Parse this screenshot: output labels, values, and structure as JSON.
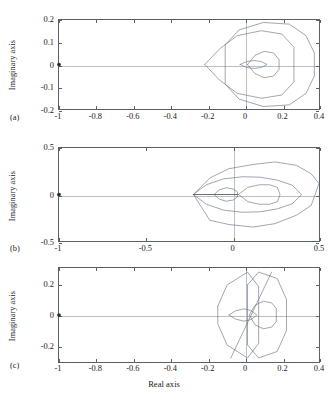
{
  "figure": {
    "background": "#ffffff",
    "curve_color": "#6c7680",
    "axis_color": "#5a6068",
    "grid_color": "#b9c0c8",
    "marker_color": "#2b2f33",
    "xlabel": "Real axis",
    "caption": ""
  },
  "panels": [
    {
      "tag": "(a)",
      "ylabel": "Imaginary axis",
      "xlabel": "",
      "xticks": [
        "-1",
        "-0.8",
        "-0.6",
        "-0.4",
        "-0.2",
        "0",
        "0.2",
        "0.4"
      ],
      "yticks": [
        "0.2",
        "0.1",
        "0",
        "-0.1",
        "-0.2"
      ]
    },
    {
      "tag": "(b)",
      "ylabel": "Imaginary axis",
      "xlabel": "",
      "xticks": [
        "-1",
        "-0.5",
        "0",
        "0.5"
      ],
      "yticks": [
        "0.5",
        "0",
        "-0.5"
      ]
    },
    {
      "tag": "(c)",
      "ylabel": "Imaginary axis",
      "xlabel": "Real axis",
      "xticks": [
        "-1",
        "-0.8",
        "-0.6",
        "-0.4",
        "-0.2",
        "0",
        "0.2",
        "0.4"
      ],
      "yticks": [
        "0.2",
        "0",
        "-0.2"
      ]
    }
  ],
  "chart_data": [
    {
      "type": "line",
      "title": "(a) Nyquist plot",
      "xlabel": "Real axis",
      "ylabel": "Imaginary axis",
      "xlim": [
        -1.0,
        0.4
      ],
      "ylim": [
        -0.27,
        0.27
      ],
      "grid": false,
      "xticks": [
        -1,
        -0.8,
        -0.6,
        -0.4,
        -0.2,
        0,
        0.2,
        0.4
      ],
      "yticks": [
        0.2,
        0.1,
        0,
        -0.1,
        -0.2
      ],
      "annotations": [
        {
          "label": "critical point",
          "x": -1.0,
          "y": 0.0,
          "marker": "dot"
        }
      ],
      "series": [
        {
          "name": "outer contour",
          "x": [
            -0.105,
            -0.03,
            0.1,
            0.24,
            0.33,
            0.375,
            0.375,
            0.33,
            0.24,
            0.1,
            -0.03,
            -0.105,
            -0.105
          ],
          "y": [
            0.12,
            0.21,
            0.255,
            0.245,
            0.175,
            0.07,
            -0.07,
            -0.175,
            -0.245,
            -0.255,
            -0.21,
            -0.12,
            0.12
          ]
        },
        {
          "name": "middle contour",
          "x": [
            -0.215,
            -0.135,
            -0.04,
            0.09,
            0.2,
            0.265,
            0.265,
            0.2,
            0.09,
            -0.04,
            -0.135,
            -0.215,
            -0.215
          ],
          "y": [
            0.0,
            0.095,
            0.175,
            0.205,
            0.185,
            0.105,
            -0.105,
            -0.185,
            -0.205,
            -0.175,
            -0.095,
            0.0,
            0.0
          ]
        },
        {
          "name": "inner contour",
          "x": [
            0.015,
            0.055,
            0.105,
            0.155,
            0.185,
            0.185,
            0.155,
            0.105,
            0.055,
            0.015,
            0.015
          ],
          "y": [
            0.0,
            0.055,
            0.08,
            0.07,
            0.03,
            -0.03,
            -0.07,
            -0.08,
            -0.055,
            0.0,
            0.0
          ]
        },
        {
          "name": "inner lens",
          "x": [
            -0.025,
            0.01,
            0.05,
            0.09,
            0.12,
            0.09,
            0.05,
            0.01,
            -0.025
          ],
          "y": [
            0.0,
            0.018,
            0.024,
            0.018,
            0.0,
            -0.018,
            -0.024,
            -0.018,
            0.0
          ]
        }
      ]
    },
    {
      "type": "line",
      "title": "(b) Nyquist plot",
      "xlabel": "Real axis",
      "ylabel": "Imaginary axis",
      "xlim": [
        -1.0,
        0.5
      ],
      "ylim": [
        -0.55,
        0.55
      ],
      "grid": false,
      "xticks": [
        -1,
        -0.5,
        0,
        0.5
      ],
      "yticks": [
        0.5,
        0,
        -0.5
      ],
      "annotations": [
        {
          "label": "critical point",
          "x": -1.0,
          "y": 0.0,
          "marker": "dot"
        }
      ],
      "series": [
        {
          "name": "outer leaf",
          "x": [
            -0.225,
            -0.13,
            -0.02,
            0.12,
            0.245,
            0.37,
            0.455,
            0.5,
            0.455,
            0.37,
            0.245,
            0.12,
            -0.02,
            -0.13,
            -0.225
          ],
          "y": [
            0.0,
            0.195,
            0.305,
            0.355,
            0.385,
            0.345,
            0.245,
            0.13,
            -0.13,
            -0.245,
            -0.345,
            -0.385,
            -0.355,
            -0.305,
            0.0
          ]
        },
        {
          "name": "mid leaf",
          "x": [
            -0.225,
            -0.15,
            -0.05,
            0.06,
            0.16,
            0.26,
            0.345,
            0.4,
            0.345,
            0.26,
            0.16,
            0.06,
            -0.05,
            -0.15,
            -0.225
          ],
          "y": [
            0.0,
            0.115,
            0.185,
            0.21,
            0.205,
            0.17,
            0.11,
            0.0,
            -0.11,
            -0.17,
            -0.205,
            -0.21,
            -0.185,
            -0.115,
            0.0
          ]
        },
        {
          "name": "inner oval right",
          "x": [
            0.035,
            0.09,
            0.155,
            0.215,
            0.26,
            0.275,
            0.26,
            0.215,
            0.155,
            0.09,
            0.035,
            0.02,
            0.035
          ],
          "y": [
            0.0,
            0.085,
            0.115,
            0.115,
            0.085,
            0.0,
            -0.085,
            -0.115,
            -0.115,
            -0.085,
            0.0,
            0.0,
            0.0
          ]
        },
        {
          "name": "small circle",
          "x": [
            -0.105,
            -0.075,
            -0.035,
            0.005,
            0.03,
            0.03,
            0.005,
            -0.035,
            -0.075,
            -0.105,
            -0.105
          ],
          "y": [
            0.0,
            0.055,
            0.08,
            0.065,
            0.03,
            -0.03,
            -0.065,
            -0.08,
            -0.055,
            0.0,
            0.0
          ]
        },
        {
          "name": "axis spike",
          "x": [
            -0.225,
            0.02
          ],
          "y": [
            0.0,
            0.0
          ]
        }
      ]
    },
    {
      "type": "line",
      "title": "(c) Nyquist plot",
      "xlabel": "Real axis",
      "ylabel": "Imaginary axis",
      "xlim": [
        -1.0,
        0.4
      ],
      "ylim": [
        -0.29,
        0.29
      ],
      "grid": false,
      "xticks": [
        -1,
        -0.8,
        -0.6,
        -0.4,
        -0.2,
        0,
        0.2,
        0.4
      ],
      "yticks": [
        0.2,
        0,
        -0.2
      ],
      "annotations": [
        {
          "label": "critical point",
          "x": -1.0,
          "y": 0.0,
          "marker": "dot"
        }
      ],
      "series": [
        {
          "name": "left hexagon",
          "x": [
            -0.145,
            -0.095,
            0.015,
            0.075,
            0.075,
            0.015,
            -0.095,
            -0.145,
            -0.145
          ],
          "y": [
            0.055,
            0.185,
            0.265,
            0.175,
            -0.175,
            -0.265,
            -0.185,
            -0.055,
            0.055
          ]
        },
        {
          "name": "right hexagon",
          "x": [
            0.015,
            0.075,
            0.175,
            0.225,
            0.225,
            0.175,
            0.075,
            0.015,
            0.015
          ],
          "y": [
            0.185,
            0.265,
            0.225,
            0.095,
            -0.095,
            -0.225,
            -0.265,
            -0.185,
            0.185
          ]
        },
        {
          "name": "inner circle",
          "x": [
            0.025,
            0.055,
            0.1,
            0.145,
            0.17,
            0.17,
            0.145,
            0.1,
            0.055,
            0.025,
            0.025
          ],
          "y": [
            0.0,
            0.06,
            0.085,
            0.075,
            0.04,
            -0.04,
            -0.075,
            -0.085,
            -0.06,
            0.0,
            0.0
          ]
        },
        {
          "name": "inner lens left",
          "x": [
            -0.085,
            -0.05,
            -0.005,
            0.035,
            0.065,
            0.035,
            -0.005,
            -0.05,
            -0.085
          ],
          "y": [
            0.0,
            0.025,
            0.038,
            0.028,
            0.0,
            -0.028,
            -0.038,
            -0.025,
            0.0
          ]
        },
        {
          "name": "diagonal chord",
          "x": [
            -0.075,
            0.145
          ],
          "y": [
            -0.265,
            0.265
          ]
        }
      ]
    }
  ]
}
